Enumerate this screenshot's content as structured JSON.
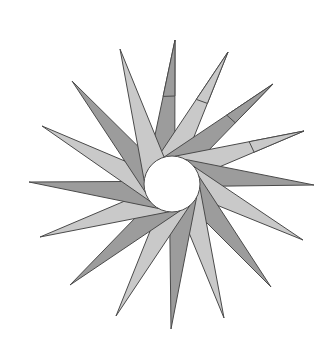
{
  "figure": {
    "type": "pinwheel-star",
    "width": 336,
    "height": 351,
    "background": "#ffffff",
    "center": [
      172,
      184
    ],
    "hub_radius": 28,
    "spike_count": 16,
    "base_span_degrees": 62,
    "colors": {
      "dark": "#9c9c9c",
      "light": "#c9c9c9",
      "outline": "#4a4a4a",
      "hub": "#ffffff"
    },
    "spikes": [
      {
        "tip": [
          175,
          40
        ],
        "shade": "dark"
      },
      {
        "tip": [
          228,
          52
        ],
        "shade": "light"
      },
      {
        "tip": [
          273,
          84
        ],
        "shade": "dark"
      },
      {
        "tip": [
          304,
          131
        ],
        "shade": "light"
      },
      {
        "tip": [
          314,
          185
        ],
        "shade": "dark"
      },
      {
        "tip": [
          303,
          240
        ],
        "shade": "light"
      },
      {
        "tip": [
          271,
          287
        ],
        "shade": "dark"
      },
      {
        "tip": [
          224,
          318
        ],
        "shade": "light"
      },
      {
        "tip": [
          171,
          329
        ],
        "shade": "dark"
      },
      {
        "tip": [
          116,
          316
        ],
        "shade": "light"
      },
      {
        "tip": [
          70,
          285
        ],
        "shade": "dark"
      },
      {
        "tip": [
          40,
          237
        ],
        "shade": "light"
      },
      {
        "tip": [
          29,
          182
        ],
        "shade": "dark"
      },
      {
        "tip": [
          42,
          126
        ],
        "shade": "light"
      },
      {
        "tip": [
          72,
          81
        ],
        "shade": "dark"
      },
      {
        "tip": [
          120,
          49
        ],
        "shade": "light"
      }
    ]
  }
}
